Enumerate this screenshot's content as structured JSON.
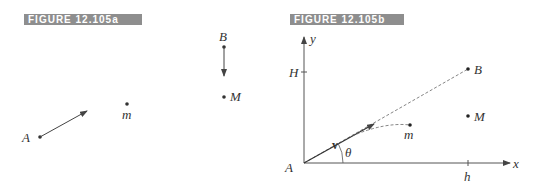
{
  "figure_a": {
    "title": "FIGURE 12.105a",
    "points": {
      "A": "A",
      "m": "m",
      "B": "B",
      "M": "M"
    }
  },
  "figure_b": {
    "title": "FIGURE 12.105b",
    "axes": {
      "x": "x",
      "y": "y"
    },
    "ticks": {
      "H": "H",
      "h": "h"
    },
    "points": {
      "A": "A",
      "m": "m",
      "B": "B",
      "M": "M"
    },
    "vector": "v",
    "angle": "θ"
  },
  "colors": {
    "label_bg": "#8e8e8e",
    "line": "#444444"
  }
}
